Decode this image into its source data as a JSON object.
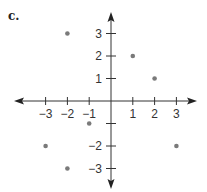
{
  "figure": {
    "label": "c."
  },
  "chart_data": {
    "type": "scatter",
    "title": "",
    "xlabel": "",
    "ylabel": "",
    "xlim": [
      -3,
      3
    ],
    "ylim": [
      -3,
      3
    ],
    "grid": false,
    "x_ticks": [
      -3,
      -2,
      -1,
      1,
      2,
      3
    ],
    "y_ticks": [
      3,
      2,
      1,
      -1,
      -2,
      -3
    ],
    "x_tick_labels": [
      "−3",
      "−2",
      "−1",
      "1",
      "2",
      "3"
    ],
    "y_tick_labels": [
      "3",
      "2",
      "1",
      "",
      "−2",
      "−3"
    ],
    "points": [
      {
        "x": -2,
        "y": 3
      },
      {
        "x": 1,
        "y": 2
      },
      {
        "x": 2,
        "y": 1
      },
      {
        "x": -1,
        "y": -1
      },
      {
        "x": -3,
        "y": -2
      },
      {
        "x": 3,
        "y": -2
      },
      {
        "x": -2,
        "y": -3
      }
    ],
    "point_color": "#7a7a7a",
    "axis_color": "#333333"
  }
}
